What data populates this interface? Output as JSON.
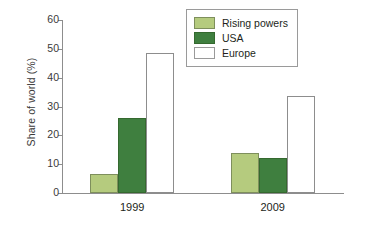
{
  "chart_data": {
    "type": "bar",
    "title": "",
    "xlabel": "",
    "ylabel": "Share of world (%)",
    "categories": [
      "1999",
      "2009"
    ],
    "series": [
      {
        "name": "Rising powers",
        "color": "#b5cb7e",
        "values": [
          6.5,
          14
        ]
      },
      {
        "name": "USA",
        "color": "#3f7f3f",
        "values": [
          26,
          12
        ]
      },
      {
        "name": "Europe",
        "color": "#ffffff",
        "values": [
          48.5,
          33.5
        ]
      }
    ],
    "ylim": [
      0,
      60
    ],
    "yticks": [
      0,
      10,
      20,
      30,
      40,
      50,
      60
    ],
    "ytick_labels": [
      "0",
      "10",
      "20",
      "30",
      "40",
      "50",
      "60"
    ],
    "grid": false,
    "legend_position": "top-right"
  },
  "legend": {
    "items": [
      {
        "label": "Rising powers",
        "swatch": "rising"
      },
      {
        "label": "USA",
        "swatch": "usa"
      },
      {
        "label": "Europe",
        "swatch": "europe"
      }
    ]
  }
}
